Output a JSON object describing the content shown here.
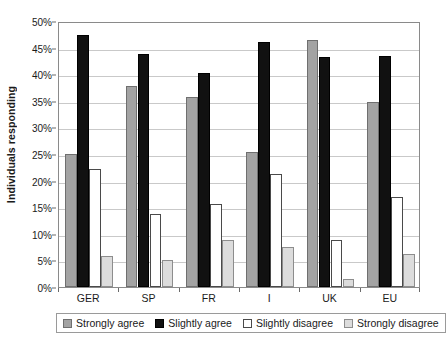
{
  "chart_data": {
    "type": "bar",
    "title": "",
    "subtitle": "",
    "xlabel": "",
    "ylabel": "Individuals responding",
    "categories": [
      "GER",
      "SP",
      "FR",
      "I",
      "UK",
      "EU"
    ],
    "series": [
      {
        "name": "Strongly agree",
        "color": "#a3a3a3",
        "values": [
          25.0,
          37.8,
          35.8,
          25.4,
          46.5,
          34.7
        ]
      },
      {
        "name": "Slightly agree",
        "color": "#111111",
        "values": [
          47.3,
          43.8,
          40.3,
          46.0,
          43.2,
          43.5
        ]
      },
      {
        "name": "Slightly disagree",
        "color": "#ffffff",
        "values": [
          22.2,
          13.8,
          15.6,
          21.3,
          8.9,
          17.0
        ]
      },
      {
        "name": "Strongly disagree",
        "color": "#dcdcdc",
        "values": [
          5.8,
          5.0,
          8.8,
          7.6,
          1.5,
          6.2
        ]
      }
    ],
    "ylim": [
      0,
      50
    ],
    "ytick_step": 5,
    "ytick_labels": [
      "0%",
      "5%",
      "10%",
      "15%",
      "20%",
      "25%",
      "30%",
      "35%",
      "40%",
      "45%",
      "50%"
    ],
    "y_value_suffix": "%",
    "grid": true,
    "grid_axis": "y",
    "legend_position": "bottom",
    "plot_background": "#ffffff"
  }
}
